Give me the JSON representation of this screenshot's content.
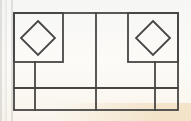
{
  "figure": {
    "canvas": {
      "width": 191,
      "height": 121
    },
    "stroke_color": "#474645",
    "stroke_width": 1.8,
    "paper_color": "#faf9f6",
    "shapes": [
      {
        "name": "outer-frame",
        "type": "rect",
        "x": 14,
        "y": 13,
        "w": 164,
        "h": 97
      },
      {
        "name": "top-left-panel",
        "type": "rect",
        "x": 14,
        "y": 13,
        "w": 49,
        "h": 49
      },
      {
        "name": "top-right-panel",
        "type": "rect",
        "x": 128,
        "y": 13,
        "w": 50,
        "h": 49
      },
      {
        "name": "left-diamond",
        "type": "diamond",
        "cx": 38,
        "cy": 38,
        "r": 17
      },
      {
        "name": "right-diamond",
        "type": "diamond",
        "cx": 153,
        "cy": 38,
        "r": 17
      },
      {
        "name": "center-divider-line",
        "type": "line",
        "x1": 96,
        "y1": 13,
        "x2": 96,
        "y2": 110
      },
      {
        "name": "left-inner-vertical-line",
        "type": "line",
        "x1": 35,
        "y1": 62,
        "x2": 35,
        "y2": 110
      },
      {
        "name": "right-inner-vertical-line",
        "type": "line",
        "x1": 155,
        "y1": 62,
        "x2": 155,
        "y2": 110
      },
      {
        "name": "lower-horizontal-line",
        "type": "line",
        "x1": 14,
        "y1": 88,
        "x2": 178,
        "y2": 88
      }
    ]
  }
}
